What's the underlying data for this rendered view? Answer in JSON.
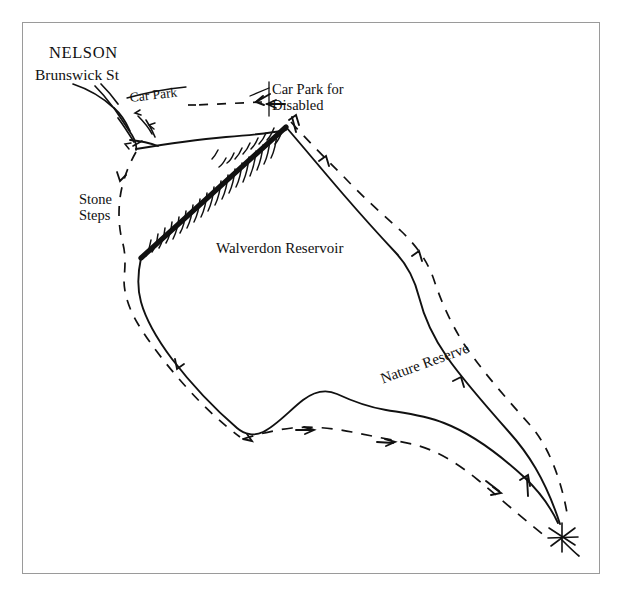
{
  "figure": {
    "kind": "hand-drawn-sketch-map",
    "frame_border_color": "#9a9a9a",
    "background_color": "#ffffff",
    "ink_color": "#111111"
  },
  "labels": {
    "town": "NELSON",
    "street": "Brunswick St",
    "car_park": "Car Park",
    "car_park_disabled_line1": "Car Park for",
    "car_park_disabled_line2": "Disabled",
    "stone_steps_line1": "Stone",
    "stone_steps_line2": "Steps",
    "reservoir": "Walverdon Reservoir",
    "nature_reserve": "Nature Reserve"
  },
  "map_features": {
    "water_body": "Walverdon Reservoir",
    "dam_wall": "thick embankment with hatched slope on north-west shore",
    "footpath_style": "dashed line with direction arrows",
    "shoreline_style": "solid thin line",
    "road_style": "solid thin line",
    "access_points": [
      "Car Park",
      "Car Park for Disabled",
      "Stone Steps"
    ],
    "path_direction_arrows": 12
  }
}
